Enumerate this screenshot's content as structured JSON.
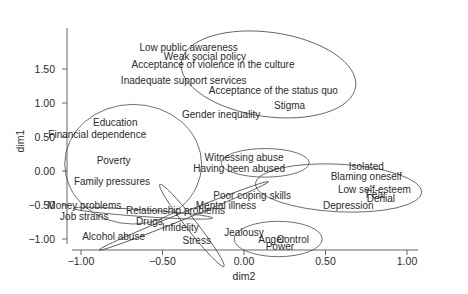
{
  "chart_data": {
    "type": "scatter",
    "title": "",
    "xlabel": "dim2",
    "ylabel": "dim1",
    "xlim": [
      -1.08,
      1.08
    ],
    "ylim": [
      -1.15,
      2.05
    ],
    "grid": false,
    "legend": null,
    "x_ticks": [
      -1.0,
      -0.5,
      0.0,
      0.5,
      1.0
    ],
    "x_tick_labels": [
      "−1.00",
      "−0.50",
      "0.00",
      "0.50",
      "1.00"
    ],
    "y_ticks": [
      -1.0,
      -0.5,
      0.0,
      0.5,
      1.0,
      1.5
    ],
    "y_tick_labels": [
      "−1.00",
      "−0.50",
      "0.00",
      "0.50",
      "1.00",
      "1.50"
    ],
    "points": [
      {
        "label": "Low public awareness",
        "x": -0.34,
        "y": 1.81
      },
      {
        "label": "Weak social policy",
        "x": -0.24,
        "y": 1.69
      },
      {
        "label": "Acceptance of violence in the culture",
        "x": -0.19,
        "y": 1.56
      },
      {
        "label": "Inadequate support services",
        "x": -0.37,
        "y": 1.33
      },
      {
        "label": "Acceptance of the status quo",
        "x": 0.18,
        "y": 1.19
      },
      {
        "label": "Stigma",
        "x": 0.28,
        "y": 0.96
      },
      {
        "label": "Gender inequality",
        "x": -0.14,
        "y": 0.83
      },
      {
        "label": "Education",
        "x": -0.79,
        "y": 0.71
      },
      {
        "label": "Financial dependence",
        "x": -0.9,
        "y": 0.53
      },
      {
        "label": "Poverty",
        "x": -0.8,
        "y": 0.16
      },
      {
        "label": "Family pressures",
        "x": -0.81,
        "y": -0.15
      },
      {
        "label": "Witnessing abuse",
        "x": 0.0,
        "y": 0.2
      },
      {
        "label": "Having been abused",
        "x": -0.03,
        "y": 0.04
      },
      {
        "label": "Isolated",
        "x": 0.75,
        "y": 0.06
      },
      {
        "label": "Blaming oneself",
        "x": 0.75,
        "y": -0.08
      },
      {
        "label": "Low self-esteem",
        "x": 0.8,
        "y": -0.27
      },
      {
        "label": "Fear",
        "x": 0.81,
        "y": -0.34
      },
      {
        "label": "Denial",
        "x": 0.84,
        "y": -0.41
      },
      {
        "label": "Depression",
        "x": 0.64,
        "y": -0.51
      },
      {
        "label": "Poor coping skills",
        "x": 0.05,
        "y": -0.36
      },
      {
        "label": "Mental illness",
        "x": -0.11,
        "y": -0.51
      },
      {
        "label": "Money problems",
        "x": -0.98,
        "y": -0.51
      },
      {
        "label": "Job strains",
        "x": -0.98,
        "y": -0.67
      },
      {
        "label": "Relationship problems",
        "x": -0.42,
        "y": -0.58
      },
      {
        "label": "Drugs",
        "x": -0.58,
        "y": -0.74
      },
      {
        "label": "Infidelity",
        "x": -0.39,
        "y": -0.83
      },
      {
        "label": "Alcohol abuse",
        "x": -0.8,
        "y": -0.97
      },
      {
        "label": "Stress",
        "x": -0.29,
        "y": -1.02
      },
      {
        "label": "Jealousy",
        "x": 0.0,
        "y": -0.91
      },
      {
        "label": "Anger",
        "x": 0.17,
        "y": -1.0
      },
      {
        "label": "Control",
        "x": 0.3,
        "y": -1.01
      },
      {
        "label": "Power",
        "x": 0.22,
        "y": -1.11
      }
    ],
    "clusters": [
      {
        "name": "societal",
        "cx": 0.15,
        "cy": 1.42,
        "rx": 0.54,
        "ry": 0.62,
        "rotate": 8
      },
      {
        "name": "economic",
        "cx": -0.68,
        "cy": 0.1,
        "rx": 0.42,
        "ry": 0.88,
        "rotate": 0
      },
      {
        "name": "abuse-history",
        "cx": 0.13,
        "cy": 0.12,
        "rx": 0.27,
        "ry": 0.21,
        "rotate": 0
      },
      {
        "name": "individual",
        "cx": 0.58,
        "cy": -0.25,
        "rx": 0.51,
        "ry": 0.35,
        "rotate": 3
      },
      {
        "name": "coping-substance",
        "cx": -0.37,
        "cy": -0.66,
        "rx": 0.56,
        "ry": 0.05,
        "rotate": -22
      },
      {
        "name": "money-relationship",
        "cx": -0.62,
        "cy": -0.62,
        "rx": 0.43,
        "ry": 0.05,
        "rotate": 4
      },
      {
        "name": "stress-infidelity",
        "cx": -0.32,
        "cy": -0.8,
        "rx": 0.32,
        "ry": 0.08,
        "rotate": 52
      },
      {
        "name": "power-control",
        "cx": 0.21,
        "cy": -1.0,
        "rx": 0.27,
        "ry": 0.26,
        "rotate": 0
      }
    ]
  }
}
